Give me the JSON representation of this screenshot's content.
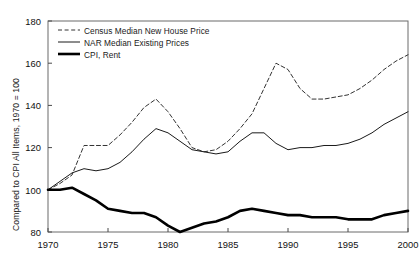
{
  "chart_data": {
    "type": "line",
    "title": "",
    "xlabel": "",
    "ylabel": "Compared to CPI All Items, 1970 = 100",
    "xlim": [
      1970,
      2000
    ],
    "ylim": [
      80,
      180
    ],
    "xticks": [
      1970,
      1975,
      1980,
      1985,
      1990,
      1995,
      2000
    ],
    "yticks": [
      80,
      100,
      120,
      140,
      160,
      180
    ],
    "xtick_labels": [
      "1970",
      "1975",
      "1980",
      "1985",
      "1990",
      "1995",
      "2000"
    ],
    "ytick_labels": [
      "80",
      "100",
      "120",
      "140",
      "160",
      "180"
    ],
    "grid": false,
    "legend_position": "upper left",
    "x": [
      1970,
      1971,
      1972,
      1973,
      1974,
      1975,
      1976,
      1977,
      1978,
      1979,
      1980,
      1981,
      1982,
      1983,
      1984,
      1985,
      1986,
      1987,
      1988,
      1989,
      1990,
      1991,
      1992,
      1993,
      1994,
      1995,
      1996,
      1997,
      1998,
      1999,
      2000
    ],
    "series": [
      {
        "name": "Census Median New House Price",
        "style": "dashed",
        "color": "#333333",
        "width": 1.0,
        "values": [
          100,
          103,
          107,
          121,
          121,
          121,
          126,
          132,
          139,
          143,
          137,
          129,
          120,
          118,
          119,
          123,
          129,
          136,
          148,
          160,
          157,
          148,
          143,
          143,
          144,
          145,
          148,
          152,
          157,
          161,
          164
        ]
      },
      {
        "name": "NAR Median Existing Prices",
        "style": "solid",
        "color": "#1a1a1a",
        "width": 1.0,
        "values": [
          100,
          104,
          108,
          110,
          109,
          110,
          113,
          118,
          124,
          129,
          127,
          123,
          119,
          118,
          117,
          118,
          123,
          127,
          127,
          122,
          119,
          120,
          120,
          121,
          121,
          122,
          124,
          127,
          131,
          134,
          137
        ]
      },
      {
        "name": "CPI, Rent",
        "style": "solid-thick",
        "color": "#000000",
        "width": 2.6,
        "values": [
          100,
          100,
          101,
          98,
          95,
          91,
          90,
          89,
          89,
          87,
          83,
          80,
          82,
          84,
          85,
          87,
          90,
          91,
          90,
          89,
          88,
          88,
          87,
          87,
          87,
          86,
          86,
          86,
          88,
          89,
          90
        ]
      }
    ],
    "legend_entries": [
      {
        "label": "Census Median New House Price",
        "style": "dashed"
      },
      {
        "label": "NAR Median Existing Prices",
        "style": "solid"
      },
      {
        "label": "CPI, Rent",
        "style": "solid-thick"
      }
    ]
  }
}
